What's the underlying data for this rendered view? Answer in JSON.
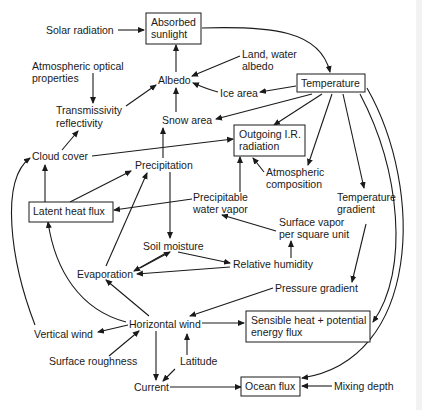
{
  "diagram": {
    "nodes": {
      "solar_radiation": {
        "label": [
          "Solar radiation"
        ],
        "boxed": false
      },
      "absorbed_sunlight": {
        "label": [
          "Absorbed",
          "sunlight"
        ],
        "boxed": true
      },
      "atmospheric_optical_properties": {
        "label": [
          "Atmospheric optical",
          "properties"
        ],
        "boxed": false
      },
      "albedo": {
        "label": [
          "Albedo"
        ],
        "boxed": false
      },
      "land_water_albedo": {
        "label": [
          "Land, water",
          "albedo"
        ],
        "boxed": false
      },
      "temperature": {
        "label": [
          "Temperature"
        ],
        "boxed": true
      },
      "transmissivity": {
        "label": [
          "Transmissivity",
          "reflectivity"
        ],
        "boxed": false
      },
      "ice_area": {
        "label": [
          "Ice area"
        ],
        "boxed": false
      },
      "snow_area": {
        "label": [
          "Snow area"
        ],
        "boxed": false
      },
      "outgoing_ir": {
        "label": [
          "Outgoing I.R.",
          "radiation"
        ],
        "boxed": true
      },
      "cloud_cover": {
        "label": [
          "Cloud cover"
        ],
        "boxed": false
      },
      "precipitation": {
        "label": [
          "Precipitation"
        ],
        "boxed": false
      },
      "atmospheric_composition": {
        "label": [
          "Atmospheric",
          "composition"
        ],
        "boxed": false
      },
      "temperature_gradient": {
        "label": [
          "Temperature",
          "gradient"
        ],
        "boxed": false
      },
      "latent_heat_flux": {
        "label": [
          "Latent heat flux"
        ],
        "boxed": true
      },
      "precipitable_water_vapor": {
        "label": [
          "Precipitable",
          "water vapor"
        ],
        "boxed": false
      },
      "surface_vapor": {
        "label": [
          "Surface vapor",
          "per square unit"
        ],
        "boxed": false
      },
      "soil_moisture": {
        "label": [
          "Soil moisture"
        ],
        "boxed": false
      },
      "relative_humidity": {
        "label": [
          "Relative humidity"
        ],
        "boxed": false
      },
      "evaporation": {
        "label": [
          "Evaporation"
        ],
        "boxed": false
      },
      "pressure_gradient": {
        "label": [
          "Pressure gradient"
        ],
        "boxed": false
      },
      "vertical_wind": {
        "label": [
          "Vertical wind"
        ],
        "boxed": false
      },
      "horizontal_wind": {
        "label": [
          "Horizontal wind"
        ],
        "boxed": false
      },
      "sensible_heat": {
        "label": [
          "Sensible heat + potential",
          "energy flux"
        ],
        "boxed": true
      },
      "surface_roughness": {
        "label": [
          "Surface roughness"
        ],
        "boxed": false
      },
      "latitude": {
        "label": [
          "Latitude"
        ],
        "boxed": false
      },
      "current": {
        "label": [
          "Current"
        ],
        "boxed": false
      },
      "ocean_flux": {
        "label": [
          "Ocean flux"
        ],
        "boxed": true
      },
      "mixing_depth": {
        "label": [
          "Mixing depth"
        ],
        "boxed": false
      }
    },
    "edges": [
      {
        "from": "solar_radiation",
        "to": "absorbed_sunlight"
      },
      {
        "from": "absorbed_sunlight",
        "to": "temperature"
      },
      {
        "from": "albedo",
        "to": "absorbed_sunlight"
      },
      {
        "from": "atmospheric_optical_properties",
        "to": "transmissivity"
      },
      {
        "from": "transmissivity",
        "to": "albedo"
      },
      {
        "from": "land_water_albedo",
        "to": "albedo"
      },
      {
        "from": "ice_area",
        "to": "albedo"
      },
      {
        "from": "snow_area",
        "to": "albedo"
      },
      {
        "from": "temperature",
        "to": "ice_area"
      },
      {
        "from": "temperature",
        "to": "snow_area"
      },
      {
        "from": "temperature",
        "to": "outgoing_ir"
      },
      {
        "from": "temperature",
        "to": "atmospheric_composition"
      },
      {
        "from": "temperature",
        "to": "temperature_gradient"
      },
      {
        "from": "temperature",
        "to": "sensible_heat"
      },
      {
        "from": "temperature",
        "to": "ocean_flux"
      },
      {
        "from": "cloud_cover",
        "to": "transmissivity"
      },
      {
        "from": "cloud_cover",
        "to": "outgoing_ir"
      },
      {
        "from": "precipitation",
        "to": "snow_area"
      },
      {
        "from": "precipitation",
        "to": "soil_moisture"
      },
      {
        "from": "atmospheric_composition",
        "to": "outgoing_ir"
      },
      {
        "from": "precipitable_water_vapor",
        "to": "outgoing_ir"
      },
      {
        "from": "precipitable_water_vapor",
        "to": "latent_heat_flux"
      },
      {
        "from": "latent_heat_flux",
        "to": "cloud_cover"
      },
      {
        "from": "latent_heat_flux",
        "to": "precipitation"
      },
      {
        "from": "surface_vapor",
        "to": "precipitable_water_vapor"
      },
      {
        "from": "relative_humidity",
        "to": "surface_vapor"
      },
      {
        "from": "soil_moisture",
        "to": "relative_humidity"
      },
      {
        "from": "soil_moisture",
        "to": "evaporation"
      },
      {
        "from": "evaporation",
        "to": "soil_moisture"
      },
      {
        "from": "relative_humidity",
        "to": "evaporation"
      },
      {
        "from": "evaporation",
        "to": "precipitation"
      },
      {
        "from": "temperature_gradient",
        "to": "pressure_gradient"
      },
      {
        "from": "pressure_gradient",
        "to": "horizontal_wind"
      },
      {
        "from": "horizontal_wind",
        "to": "evaporation"
      },
      {
        "from": "horizontal_wind",
        "to": "latent_heat_flux"
      },
      {
        "from": "horizontal_wind",
        "to": "vertical_wind"
      },
      {
        "from": "horizontal_wind",
        "to": "sensible_heat"
      },
      {
        "from": "horizontal_wind",
        "to": "current"
      },
      {
        "from": "vertical_wind",
        "to": "cloud_cover"
      },
      {
        "from": "surface_roughness",
        "to": "horizontal_wind"
      },
      {
        "from": "latitude",
        "to": "horizontal_wind"
      },
      {
        "from": "latitude",
        "to": "current"
      },
      {
        "from": "current",
        "to": "ocean_flux"
      },
      {
        "from": "mixing_depth",
        "to": "ocean_flux"
      }
    ]
  }
}
